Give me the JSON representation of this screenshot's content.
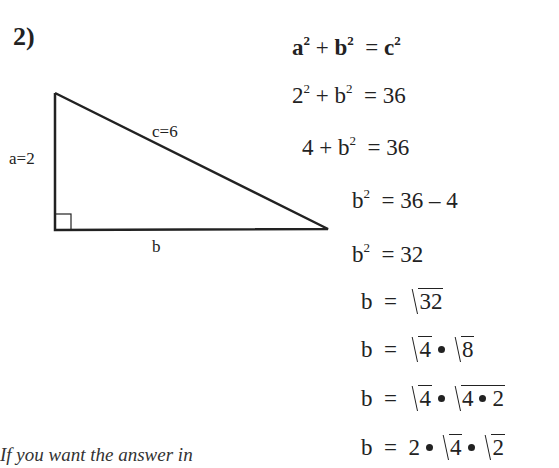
{
  "problem": {
    "number": "2)",
    "triangle": {
      "side_a_label": "a=2",
      "side_b_label": "b",
      "side_c_label": "c=6",
      "right_angle_marker": true
    },
    "equations": [
      {
        "lhs": [
          "a",
          "2",
          " + ",
          "b",
          "2"
        ],
        "rhs": "= c²",
        "text": "a² + b² = c²"
      },
      {
        "text": "2² + b² = 36",
        "lhs_base1": "2",
        "lhs_exp1": "2",
        "plus": "+",
        "lhs_base2": "b",
        "lhs_exp2": "2",
        "rhs": "= 36"
      },
      {
        "text": "4 + b² = 36",
        "lhs_a": "4 +",
        "lhs_base": "b",
        "lhs_exp": "2",
        "rhs": "= 36"
      },
      {
        "text": "b² = 36 – 4",
        "lhs_base": "b",
        "lhs_exp": "2",
        "rhs": "= 36 – 4"
      },
      {
        "text": "b² = 32",
        "lhs_base": "b",
        "lhs_exp": "2",
        "rhs": "= 32"
      },
      {
        "text": "b = √32",
        "lhs": "b",
        "eq": "=",
        "rad1": "32"
      },
      {
        "text": "b = √4 • √8",
        "lhs": "b",
        "eq": "=",
        "rad1": "4",
        "rad2": "8"
      },
      {
        "text": "b = √4 • √4 • 2",
        "lhs": "b",
        "eq": "=",
        "rad1": "4",
        "rad2_a": "4",
        "rad2_b": "2"
      },
      {
        "text": "b = 2 • √4 • √2",
        "lhs": "b",
        "eq": "=",
        "coef": "2",
        "rad1": "4",
        "rad2": "2"
      }
    ],
    "bold_first": {
      "a": "a",
      "exp": "2",
      "plus": "+",
      "b": "b",
      "rhs_eq": "=",
      "c": "c"
    },
    "note": "If you want the answer in"
  }
}
